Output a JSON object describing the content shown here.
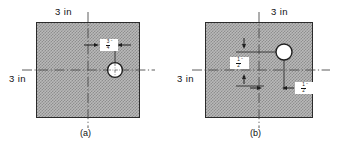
{
  "figure": {
    "type": "engineering-dimension-diagram"
  },
  "panels": [
    {
      "id": "a",
      "caption": "(a)",
      "top_label": "3 in",
      "left_label": "3 in",
      "plate": {
        "width_in": 3,
        "height_in": 3
      },
      "hole": {
        "offset_x_label": "3/4\"",
        "on_horizontal_centerline": true
      },
      "dimensions": [
        {
          "name": "hole-offset-horizontal",
          "numerator": "3",
          "denominator": "4",
          "unit": "\"",
          "orientation": "horizontal"
        }
      ]
    },
    {
      "id": "b",
      "caption": "(b)",
      "top_label": "3 in",
      "left_label": "3 in",
      "plate": {
        "width_in": 3,
        "height_in": 3
      },
      "hole": {
        "offset_x_label": "1/2\"",
        "offset_y_label": "1/2\"",
        "on_horizontal_centerline": false
      },
      "dimensions": [
        {
          "name": "hole-offset-vertical",
          "numerator": "1",
          "denominator": "2",
          "unit": "\"",
          "orientation": "vertical"
        },
        {
          "name": "hole-offset-horizontal",
          "numerator": "1",
          "denominator": "2",
          "unit": "\"",
          "orientation": "horizontal"
        }
      ]
    }
  ],
  "colors": {
    "plate_fill": "#b9b9b9",
    "plate_hatch": "#8e8e8e",
    "outline": "#2b2b2b",
    "centerline": "#4a4a4a",
    "text": "#111111",
    "hole_fill": "#ffffff"
  }
}
